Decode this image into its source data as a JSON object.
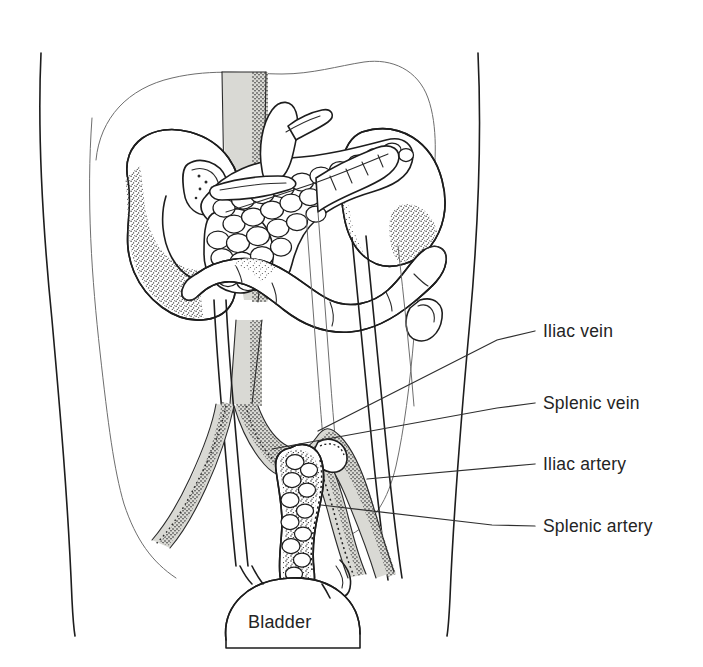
{
  "figure": {
    "kind": "anatomical-line-illustration",
    "background_color": "#ffffff",
    "ink_color": "#1d1d1d",
    "vessel_fill_color": "#d9d9d4",
    "label_color": "#242424"
  },
  "labels": [
    {
      "id": "iliac-vein",
      "text": "Iliac vein",
      "text_x": 543,
      "text_y": 337,
      "leader": "M 535 331 L 497 340 L 318 431"
    },
    {
      "id": "splenic-vein",
      "text": "Splenic vein",
      "text_x": 543,
      "text_y": 409,
      "leader": "M 535 403 L 497 408 L 272 449"
    },
    {
      "id": "iliac-artery",
      "text": "Iliac artery",
      "text_x": 543,
      "text_y": 470,
      "leader": "M 535 464 L 367 479"
    },
    {
      "id": "splenic-artery",
      "text": "Splenic artery",
      "text_x": 543,
      "text_y": 532,
      "leader": "M 535 526 L 492 525 L 321 505"
    },
    {
      "id": "bladder",
      "text": "Bladder",
      "text_x": 290,
      "text_y": 628
    }
  ],
  "structures": [
    {
      "id": "torso-left-flank",
      "name": "left body wall"
    },
    {
      "id": "torso-right-flank",
      "name": "right body wall"
    },
    {
      "id": "abdominal-cavity",
      "name": "abdominal cavity outline"
    },
    {
      "id": "aorta",
      "name": "aorta"
    },
    {
      "id": "duodenum",
      "name": "duodenum"
    },
    {
      "id": "native-pancreas",
      "name": "native pancreas"
    },
    {
      "id": "transverse-colon",
      "name": "transverse colon"
    },
    {
      "id": "iliac-bifurcation",
      "name": "iliac vessel bifurcation"
    },
    {
      "id": "graft-pancreas",
      "name": "transplanted pancreas graft"
    },
    {
      "id": "bladder-dome",
      "name": "bladder"
    }
  ]
}
